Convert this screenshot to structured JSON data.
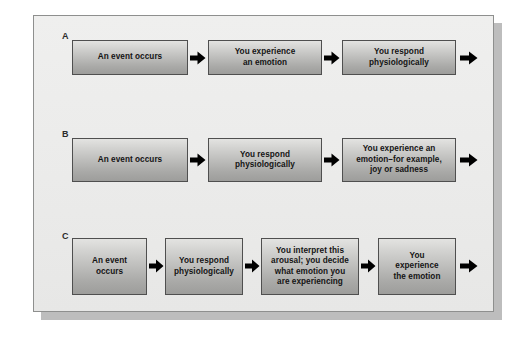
{
  "figure": {
    "type": "flowchart",
    "colors": {
      "panel_background": "#ebebea",
      "panel_border": "#8e8f8e",
      "box_fill_top": "#e3e3e1",
      "box_fill_bottom": "#9d9d9b",
      "box_border": "#4f4f4f",
      "arrow": "#000000",
      "text": "#141414"
    },
    "rows": [
      {
        "label": "A",
        "label_x": 62,
        "label_y": 31,
        "box_top": 40,
        "box_height": 35,
        "arrow_y": 51,
        "trailing_arrow": true,
        "boxes": [
          {
            "text": "An event occurs",
            "x": 72,
            "width": 116
          },
          {
            "text": "You experience\nan emotion",
            "x": 208,
            "width": 114
          },
          {
            "text": "You respond\nphysiologically",
            "x": 342,
            "width": 114
          }
        ],
        "arrows": [
          {
            "x": 190,
            "width": 16
          },
          {
            "x": 324,
            "width": 16
          },
          {
            "x": 460,
            "width": 18
          }
        ]
      },
      {
        "label": "B",
        "label_x": 62,
        "label_y": 129,
        "box_top": 138,
        "box_height": 44,
        "arrow_y": 153,
        "trailing_arrow": true,
        "boxes": [
          {
            "text": "An event occurs",
            "x": 72,
            "width": 116
          },
          {
            "text": "You respond\nphysiologically",
            "x": 208,
            "width": 114
          },
          {
            "text": "You experience an\nemotion–for example,\njoy or sadness",
            "x": 342,
            "width": 114
          }
        ],
        "arrows": [
          {
            "x": 190,
            "width": 16
          },
          {
            "x": 324,
            "width": 16
          },
          {
            "x": 460,
            "width": 18
          }
        ]
      },
      {
        "label": "C",
        "label_x": 62,
        "label_y": 231,
        "box_top": 238,
        "box_height": 57,
        "arrow_y": 259,
        "trailing_arrow": true,
        "boxes": [
          {
            "text": "An event\noccurs",
            "x": 72,
            "width": 75
          },
          {
            "text": "You respond\nphysiologically",
            "x": 165,
            "width": 78
          },
          {
            "text": "You interrupt-placeholder",
            "x": 261,
            "width": 98
          },
          {
            "text": "You\nexperience\nthe emotion",
            "x": 378,
            "width": 78
          }
        ],
        "arrows": [
          {
            "x": 149,
            "width": 15
          },
          {
            "x": 245,
            "width": 15
          },
          {
            "x": 361,
            "width": 15
          },
          {
            "x": 460,
            "width": 18
          }
        ]
      }
    ],
    "box_texts": {
      "a1": "An event occurs",
      "a2": "You experience\nan emotion",
      "a3": "You respond\nphysiologically",
      "b1": "An event occurs",
      "b2": "You respond\nphysiologically",
      "b3": "You experience an\nemotion–for example,\njoy or sadness",
      "c1": "An event\noccurs",
      "c2": "You respond\nphysiologically",
      "c3": "You interpret this\narousal; you decide\nwhat emotion you\nare experiencing",
      "c4": "You\nexperience\nthe emotion"
    },
    "labels": {
      "a": "A",
      "b": "B",
      "c": "C"
    }
  }
}
